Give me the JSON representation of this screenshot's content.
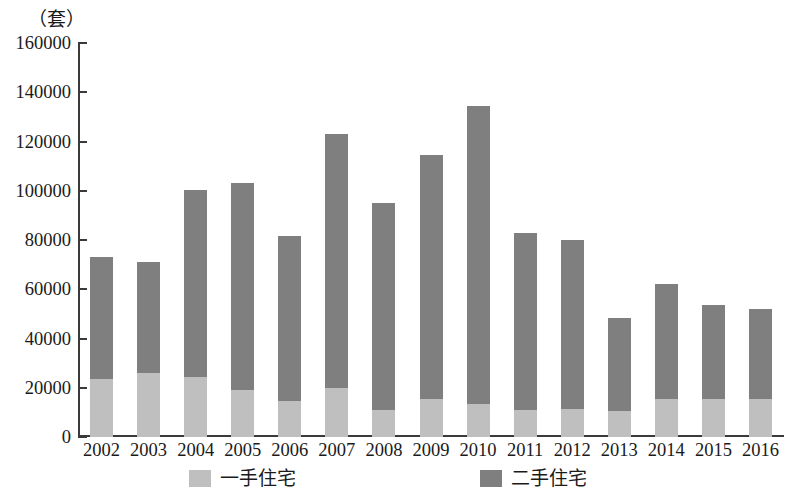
{
  "chart_data": {
    "type": "bar",
    "stacked": true,
    "title": "",
    "subtitle": "",
    "unit_label": "（套）",
    "xlabel": "",
    "ylabel": "",
    "ylim": [
      0,
      160000
    ],
    "ytick_step": 20000,
    "yticks": [
      0,
      20000,
      40000,
      60000,
      80000,
      100000,
      120000,
      140000,
      160000
    ],
    "ytick_labels": [
      "0",
      "20000",
      "40000",
      "60000",
      "80000",
      "100000",
      "120000",
      "140000",
      "160000"
    ],
    "grid": false,
    "legend_position": "bottom",
    "categories": [
      "2002",
      "2003",
      "2004",
      "2005",
      "2006",
      "2007",
      "2008",
      "2009",
      "2010",
      "2011",
      "2012",
      "2013",
      "2014",
      "2015",
      "2016"
    ],
    "series": [
      {
        "name": "一手住宅",
        "color": "#bfbfbf",
        "values": [
          23500,
          26000,
          24500,
          19000,
          14500,
          20000,
          11000,
          15500,
          13500,
          11000,
          11500,
          10500,
          15500,
          15500,
          15500
        ]
      },
      {
        "name": "二手住宅",
        "color": "#7f7f7f",
        "values": [
          49500,
          45000,
          76000,
          84000,
          67000,
          103000,
          84000,
          99000,
          121000,
          72000,
          68500,
          38000,
          46500,
          38000,
          36500
        ]
      }
    ],
    "totals": [
      73000,
      71000,
      100500,
      103000,
      81500,
      123000,
      95000,
      114500,
      134500,
      83000,
      80000,
      48500,
      62000,
      53500,
      52000
    ]
  },
  "legend": {
    "items": [
      {
        "label": "一手住宅",
        "color": "#bfbfbf"
      },
      {
        "label": "二手住宅",
        "color": "#7f7f7f"
      }
    ]
  }
}
